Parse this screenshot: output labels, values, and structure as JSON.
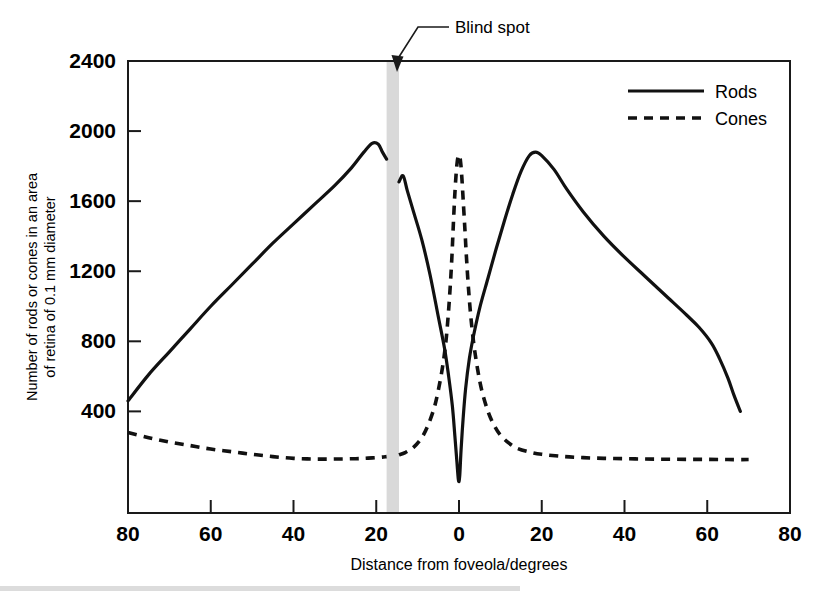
{
  "figure": {
    "name": "rod-and-cone-density-across-retina",
    "background": "#ffffff",
    "ink_color": "#111111",
    "blind_spot_band_color": "#d9d9d9"
  },
  "annotations": [
    {
      "label": "Blind spot",
      "points_to_degrees": -16.5
    }
  ],
  "legend": {
    "position": "top-right-inside",
    "entries": [
      {
        "label": "Rods",
        "style": "solid"
      },
      {
        "label": "Cones",
        "style": "dashed"
      }
    ]
  },
  "chart_data": {
    "type": "line",
    "title": "",
    "xlabel": "Distance from foveola/degrees",
    "ylabel": "Number of rods or cones in an area of retina of 0.1 mm diameter",
    "ylabel_line1": "Number of rods or cones in an area",
    "ylabel_line2": "of retina of 0.1 mm diameter",
    "grid": false,
    "xlim": [
      -80,
      80
    ],
    "ylim": [
      0,
      2400
    ],
    "x_tick_values": [
      -80,
      -60,
      -40,
      -20,
      0,
      20,
      40,
      60,
      80
    ],
    "x_tick_labels": [
      "80",
      "60",
      "40",
      "20",
      "0",
      "20",
      "40",
      "60",
      "80"
    ],
    "y_tick_values": [
      400,
      800,
      1200,
      1600,
      2000,
      2400
    ],
    "y_tick_labels": [
      "400",
      "800",
      "1200",
      "1600",
      "2000",
      "2400"
    ],
    "x_axis_note": "negative values are nasal (left of foveola); labels shown unsigned",
    "blind_spot": {
      "start_degrees": -17.5,
      "end_degrees": -14.5,
      "shaded": true
    },
    "series": [
      {
        "name": "Rods",
        "style": "solid",
        "points": [
          [
            -80,
            460
          ],
          [
            -75,
            610
          ],
          [
            -70,
            740
          ],
          [
            -65,
            870
          ],
          [
            -60,
            1000
          ],
          [
            -55,
            1120
          ],
          [
            -50,
            1240
          ],
          [
            -45,
            1360
          ],
          [
            -40,
            1470
          ],
          [
            -35,
            1580
          ],
          [
            -30,
            1690
          ],
          [
            -26,
            1790
          ],
          [
            -23,
            1880
          ],
          [
            -21,
            1930
          ],
          [
            -19.5,
            1925
          ],
          [
            -18.5,
            1880
          ],
          [
            -17.5,
            1840
          ],
          [
            -14.5,
            1710
          ],
          [
            -13.5,
            1745
          ],
          [
            -12.5,
            1660
          ],
          [
            -11,
            1540
          ],
          [
            -9,
            1380
          ],
          [
            -7,
            1180
          ],
          [
            -5,
            940
          ],
          [
            -3.5,
            760
          ],
          [
            -2.5,
            600
          ],
          [
            -1.6,
            430
          ],
          [
            -1.0,
            260
          ],
          [
            -0.5,
            110
          ],
          [
            -0.2,
            20
          ],
          [
            0,
            0
          ],
          [
            0.2,
            40
          ],
          [
            0.5,
            180
          ],
          [
            1.0,
            360
          ],
          [
            1.6,
            530
          ],
          [
            2.5,
            700
          ],
          [
            3.5,
            830
          ],
          [
            5,
            990
          ],
          [
            7,
            1160
          ],
          [
            9,
            1330
          ],
          [
            11,
            1490
          ],
          [
            13,
            1640
          ],
          [
            15,
            1770
          ],
          [
            17,
            1860
          ],
          [
            18.5,
            1880
          ],
          [
            20,
            1860
          ],
          [
            23,
            1780
          ],
          [
            26,
            1670
          ],
          [
            30,
            1540
          ],
          [
            35,
            1400
          ],
          [
            40,
            1280
          ],
          [
            45,
            1170
          ],
          [
            50,
            1060
          ],
          [
            55,
            950
          ],
          [
            58,
            880
          ],
          [
            61,
            790
          ],
          [
            63,
            700
          ],
          [
            65,
            590
          ],
          [
            66.5,
            490
          ],
          [
            68,
            400
          ]
        ]
      },
      {
        "name": "Cones",
        "style": "dashed",
        "points": [
          [
            -80,
            280
          ],
          [
            -75,
            250
          ],
          [
            -70,
            225
          ],
          [
            -65,
            205
          ],
          [
            -60,
            185
          ],
          [
            -55,
            170
          ],
          [
            -50,
            155
          ],
          [
            -45,
            142
          ],
          [
            -40,
            132
          ],
          [
            -35,
            128
          ],
          [
            -30,
            128
          ],
          [
            -25,
            130
          ],
          [
            -22,
            133
          ],
          [
            -19,
            138
          ],
          [
            -17.5,
            142
          ],
          [
            -14.5,
            152
          ],
          [
            -13,
            165
          ],
          [
            -11,
            195
          ],
          [
            -9,
            250
          ],
          [
            -7.5,
            320
          ],
          [
            -6,
            420
          ],
          [
            -5,
            520
          ],
          [
            -4,
            650
          ],
          [
            -3.2,
            790
          ],
          [
            -2.6,
            950
          ],
          [
            -2.1,
            1120
          ],
          [
            -1.7,
            1290
          ],
          [
            -1.4,
            1450
          ],
          [
            -1.1,
            1600
          ],
          [
            -0.8,
            1720
          ],
          [
            -0.5,
            1810
          ],
          [
            -0.2,
            1855
          ],
          [
            0.1,
            1860
          ],
          [
            0.4,
            1820
          ],
          [
            0.7,
            1730
          ],
          [
            1.0,
            1610
          ],
          [
            1.4,
            1450
          ],
          [
            1.8,
            1280
          ],
          [
            2.3,
            1100
          ],
          [
            2.9,
            930
          ],
          [
            3.6,
            780
          ],
          [
            4.5,
            640
          ],
          [
            5.5,
            520
          ],
          [
            7,
            400
          ],
          [
            8.5,
            320
          ],
          [
            10,
            265
          ],
          [
            12,
            220
          ],
          [
            14,
            190
          ],
          [
            17,
            168
          ],
          [
            20,
            155
          ],
          [
            25,
            143
          ],
          [
            30,
            136
          ],
          [
            35,
            132
          ],
          [
            40,
            130
          ],
          [
            45,
            128
          ],
          [
            50,
            127
          ],
          [
            55,
            126
          ],
          [
            60,
            126
          ],
          [
            65,
            125
          ],
          [
            70,
            125
          ]
        ]
      }
    ]
  },
  "plot_geometry": {
    "left_px": 128,
    "right_px": 790,
    "top_px": 61,
    "bottom_px": 513,
    "y_value_at_bottom": -180,
    "y_value_at_top": 2400
  }
}
